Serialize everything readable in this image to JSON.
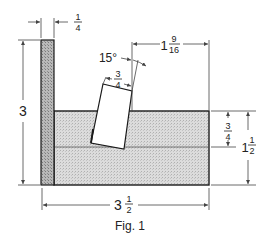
{
  "figure": {
    "caption": "Fig. 1",
    "colors": {
      "outline": "#1a1a1a",
      "hatch_dark": "#8a8a8a",
      "hatch_light": "#c8c8c8",
      "dimension_line": "#444444",
      "background": "#ffffff"
    },
    "dimensions": {
      "top_thickness": {
        "whole": "",
        "num": "1",
        "den": "4"
      },
      "left_height": {
        "whole": "3",
        "num": "",
        "den": ""
      },
      "angle": {
        "text": "15°"
      },
      "slot_width": {
        "whole": "",
        "num": "3",
        "den": "4"
      },
      "top_right_offset": {
        "whole": "1",
        "num": "9",
        "den": "16"
      },
      "right_inner_height": {
        "whole": "",
        "num": "3",
        "den": "4"
      },
      "right_total_height": {
        "whole": "1",
        "num": "1",
        "den": "2"
      },
      "bottom_width": {
        "whole": "3",
        "num": "1",
        "den": "2"
      }
    }
  }
}
